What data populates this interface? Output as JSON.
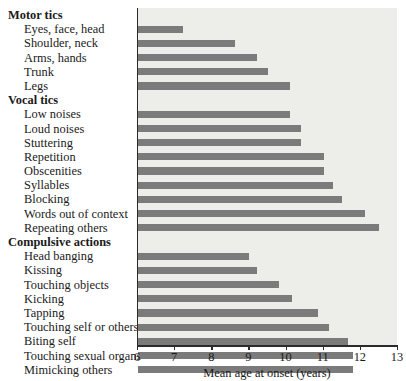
{
  "chart_data": {
    "type": "bar",
    "orientation": "horizontal",
    "title": "",
    "xlabel": "Mean age at onset (years)",
    "ylabel": "",
    "xlim": [
      6,
      13
    ],
    "xticks": [
      6,
      7,
      8,
      9,
      10,
      11,
      12,
      13
    ],
    "grid": false,
    "legend": null,
    "bar_color": "#7b7b7b",
    "plot_background": "#ededea",
    "groups": [
      {
        "name": "Motor tics",
        "categories": [
          "Eyes, face, head",
          "Shoulder, neck",
          "Arms, hands",
          "Trunk",
          "Legs"
        ],
        "values": [
          7.2,
          8.6,
          9.2,
          9.5,
          10.1
        ]
      },
      {
        "name": "Vocal tics",
        "categories": [
          "Low noises",
          "Loud noises",
          "Stuttering",
          "Repetition",
          "Obscenities",
          "Syllables",
          "Blocking",
          "Words out of context",
          "Repeating others"
        ],
        "values": [
          10.1,
          10.4,
          10.4,
          11.0,
          11.0,
          11.25,
          11.5,
          12.1,
          12.5
        ]
      },
      {
        "name": "Compulsive actions",
        "categories": [
          "Head banging",
          "Kissing",
          "Touching objects",
          "Kicking",
          "Tapping",
          "Touching self or others",
          "Biting self",
          "Touching sexual organs",
          "Mimicking others"
        ],
        "values": [
          9.0,
          9.2,
          9.8,
          10.15,
          10.85,
          11.15,
          11.65,
          11.8,
          11.8
        ]
      }
    ],
    "categories": [
      "Eyes, face, head",
      "Shoulder, neck",
      "Arms, hands",
      "Trunk",
      "Legs",
      "Low noises",
      "Loud noises",
      "Stuttering",
      "Repetition",
      "Obscenities",
      "Syllables",
      "Blocking",
      "Words out of context",
      "Repeating others",
      "Head banging",
      "Kissing",
      "Touching objects",
      "Kicking",
      "Tapping",
      "Touching self or others",
      "Biting self",
      "Touching sexual organs",
      "Mimicking others"
    ],
    "values": [
      7.2,
      8.6,
      9.2,
      9.5,
      10.1,
      10.1,
      10.4,
      10.4,
      11.0,
      11.0,
      11.25,
      11.5,
      12.1,
      12.5,
      9.0,
      9.2,
      9.8,
      10.15,
      10.85,
      11.15,
      11.65,
      11.8,
      11.8
    ]
  },
  "labels": {
    "group_motor": "Motor tics",
    "group_vocal": "Vocal tics",
    "group_compulsive": "Compulsive actions",
    "motor": [
      "Eyes, face, head",
      "Shoulder, neck",
      "Arms, hands",
      "Trunk",
      "Legs"
    ],
    "vocal": [
      "Low noises",
      "Loud noises",
      "Stuttering",
      "Repetition",
      "Obscenities",
      "Syllables",
      "Blocking",
      "Words out of context",
      "Repeating others"
    ],
    "compulsive": [
      "Head banging",
      "Kissing",
      "Touching objects",
      "Kicking",
      "Tapping",
      "Touching self or others",
      "Biting self",
      "Touching sexual organs",
      "Mimicking others"
    ]
  },
  "axis": {
    "x_title": "Mean age at onset (years)",
    "tick_labels": [
      "6",
      "7",
      "8",
      "9",
      "10",
      "11",
      "12",
      "13"
    ]
  }
}
